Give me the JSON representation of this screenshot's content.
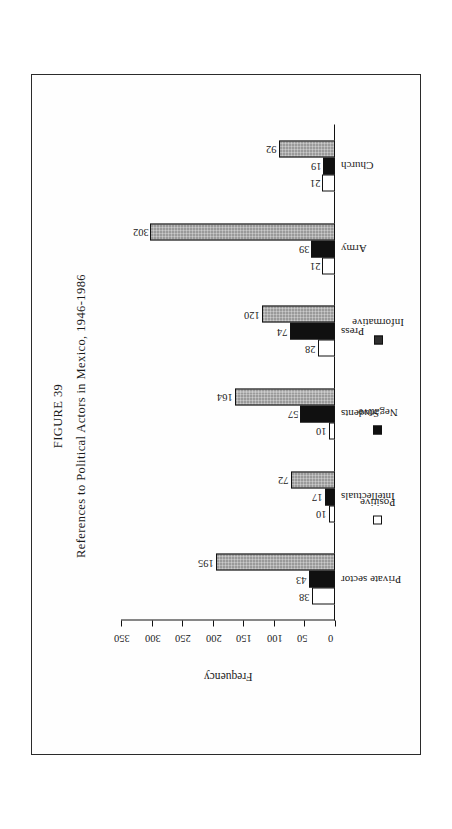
{
  "figure": {
    "title": "FIGURE 39",
    "subtitle": "References to Political Actors in Mexico, 1946-1986"
  },
  "chart_data": {
    "type": "bar",
    "title": "FIGURE 39",
    "subtitle": "References to Political Actors in Mexico, 1946-1986",
    "xlabel": "",
    "ylabel": "Frequency",
    "ylim": [
      0,
      350
    ],
    "yticks": [
      0,
      50,
      100,
      150,
      200,
      250,
      300,
      350
    ],
    "ytick_labels": [
      "0",
      "50",
      "100",
      "150",
      "200",
      "250",
      "300",
      "350"
    ],
    "grid": false,
    "legend_position": "bottom",
    "orientation": "vertical-bars-on-rotated-page",
    "categories": [
      "Private sector",
      "Intellectuals",
      "Students",
      "Press",
      "Army",
      "Church"
    ],
    "series": [
      {
        "name": "Positive",
        "color": "#ffffff",
        "values": [
          38,
          10,
          10,
          28,
          21,
          21
        ]
      },
      {
        "name": "Negative",
        "color": "#101010",
        "values": [
          43,
          17,
          57,
          74,
          39,
          19
        ]
      },
      {
        "name": "Informative",
        "color": "#9a9a9a",
        "values": [
          195,
          72,
          164,
          120,
          302,
          92
        ]
      }
    ]
  },
  "axis": {
    "caption": "Frequency",
    "ticks": [
      "350",
      "300",
      "250",
      "200",
      "150",
      "100",
      "50",
      "0"
    ]
  },
  "legend": {
    "items": [
      {
        "label": "Positive",
        "swatch": "positive"
      },
      {
        "label": "Negative",
        "swatch": "negative"
      },
      {
        "label": "Informative",
        "swatch": "informative"
      }
    ]
  },
  "colors": {
    "positive": "#ffffff",
    "negative": "#101010",
    "informative": "#9a9a9a",
    "ink": "#1a1a1a",
    "frame": "#2b2b2b",
    "paper": "#ffffff"
  }
}
